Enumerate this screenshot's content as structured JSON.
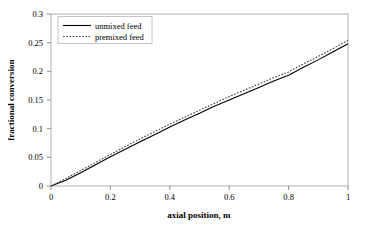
{
  "chart_data": {
    "type": "line",
    "title": "",
    "xlabel": "axial position, m",
    "ylabel": "fractional conversion",
    "xlim": [
      0,
      1
    ],
    "ylim": [
      0,
      0.3
    ],
    "grid": false,
    "legend_position": "top-left",
    "xticks": [
      "0",
      "0.2",
      "0.4",
      "0.6",
      "0.8",
      "1"
    ],
    "xtick_values": [
      0,
      0.2,
      0.4,
      0.6,
      0.8,
      1
    ],
    "yticks": [
      "0",
      "0.05",
      "0.1",
      "0.15",
      "0.2",
      "0.25",
      "0.3"
    ],
    "ytick_values": [
      0,
      0.05,
      0.1,
      0.15,
      0.2,
      0.25,
      0.3
    ],
    "x": [
      0,
      0.05,
      0.1,
      0.15,
      0.2,
      0.25,
      0.3,
      0.35,
      0.4,
      0.45,
      0.5,
      0.55,
      0.6,
      0.65,
      0.7,
      0.75,
      0.8,
      0.85,
      0.9,
      0.95,
      1
    ],
    "series": [
      {
        "name": "unmixed feed",
        "style": "solid",
        "color": "#000000",
        "values": [
          0,
          0.01,
          0.023,
          0.037,
          0.051,
          0.064,
          0.077,
          0.09,
          0.103,
          0.115,
          0.127,
          0.139,
          0.15,
          0.161,
          0.172,
          0.183,
          0.193,
          0.207,
          0.22,
          0.234,
          0.248
        ]
      },
      {
        "name": "premixed feed",
        "style": "dotted",
        "color": "#3a3a3a",
        "values": [
          0,
          0.013,
          0.027,
          0.041,
          0.055,
          0.069,
          0.082,
          0.095,
          0.108,
          0.12,
          0.132,
          0.144,
          0.156,
          0.167,
          0.178,
          0.189,
          0.199,
          0.213,
          0.226,
          0.24,
          0.254
        ]
      }
    ]
  },
  "legend": {
    "items": [
      {
        "label": "unmixed feed"
      },
      {
        "label": "premixed feed"
      }
    ]
  }
}
